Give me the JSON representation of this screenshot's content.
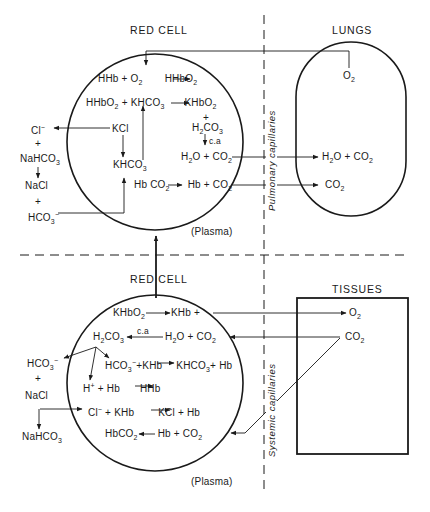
{
  "top_panel": {
    "red_cell_label": "RED CELL",
    "lungs_label": "LUNGS",
    "plasma_label": "(Plasma)",
    "capillary_label": "Pulmonary capillaries",
    "equations": {
      "eq1": "HHb + O₂ → HHbO₂",
      "eq2": "HHbO₂ + KHCO₃ → KHbO₂",
      "plus1": "+",
      "h2co3": "H₂CO₃",
      "ca": "c.a",
      "h2o_co2": "H₂O + CO₂",
      "hbco2": "Hb CO₂ → Hb + CO₂",
      "kcl": "KCl",
      "khco3": "KHCO₃"
    },
    "plasma_side": {
      "cl": "Cl⁻",
      "plus_a": "+",
      "nahco3": "NaHCO₃",
      "nacl": "NaCl",
      "plus_b": "+",
      "hco3": "HCO₃⁻"
    },
    "lungs_side": {
      "o2": "O₂",
      "h2o_co2": "H₂O + CO₂",
      "co2": "CO₂"
    }
  },
  "bottom_panel": {
    "red_cell_label": "RED CELL",
    "tissues_label": "TISSUES",
    "plasma_label": "(Plasma)",
    "capillary_label": "Systemic capillaries",
    "equations": {
      "eq1": "KHbO₂ → KHb +",
      "h2co3": "H₂CO₃",
      "ca": "c.a",
      "h2o_co2": "H₂O + CO₂",
      "eq3": "HCO₃⁻ + KHb → KHCO₃ + Hb",
      "eq4": "H⁺ + Hb → HHb",
      "eq5": "Cl⁻ + KHb → KCl + Hb",
      "eq6": "HbCO₂ ← Hb + CO₂"
    },
    "plasma_side": {
      "hco3": "HCO₃⁻",
      "plus": "+",
      "nacl": "NaCl",
      "nahco3": "NaHCO₃"
    },
    "tissues_side": {
      "o2": "O₂",
      "co2": "CO₂"
    }
  }
}
